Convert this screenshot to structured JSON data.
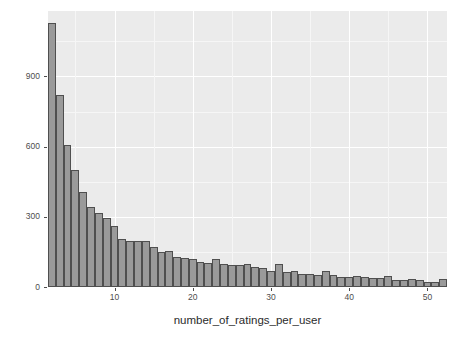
{
  "chart_data": {
    "type": "bar",
    "title": "",
    "subtitle": "",
    "xlabel": "number_of_ratings_per_user",
    "ylabel": "count",
    "xlim": [
      1.5,
      52.5
    ],
    "ylim": [
      0,
      1180
    ],
    "grid": true,
    "legend": null,
    "bin_width": 1,
    "x_ticks": [
      10,
      20,
      30,
      40,
      50
    ],
    "y_ticks": [
      0,
      300,
      600,
      900
    ],
    "x_tick_labels": [
      "10",
      "20",
      "30",
      "40",
      "50"
    ],
    "y_tick_labels": [
      "0",
      "300",
      "600",
      "900"
    ],
    "categories": [
      2,
      3,
      4,
      5,
      6,
      7,
      8,
      9,
      10,
      11,
      12,
      13,
      14,
      15,
      16,
      17,
      18,
      19,
      20,
      21,
      22,
      23,
      24,
      25,
      26,
      27,
      28,
      29,
      30,
      31,
      32,
      33,
      34,
      35,
      36,
      37,
      38,
      39,
      40,
      41,
      42,
      43,
      44,
      45,
      46,
      47,
      48,
      49,
      50,
      51,
      52
    ],
    "values": [
      1130,
      820,
      605,
      500,
      405,
      340,
      315,
      295,
      260,
      205,
      198,
      198,
      195,
      170,
      148,
      152,
      130,
      122,
      121,
      108,
      103,
      119,
      100,
      92,
      93,
      100,
      85,
      82,
      67,
      97,
      66,
      70,
      54,
      57,
      52,
      68,
      50,
      42,
      43,
      45,
      44,
      40,
      38,
      47,
      30,
      32,
      33,
      31,
      20,
      20,
      33
    ],
    "bar_fill_color": "#9a9a9a",
    "bar_border_color": "#4f4f4f",
    "panel_background": "#ebebeb",
    "gridline_color": "#ffffff",
    "text_color": "#4d4d4d"
  },
  "axes": {
    "y_title": "count",
    "x_title": "number_of_ratings_per_user"
  }
}
